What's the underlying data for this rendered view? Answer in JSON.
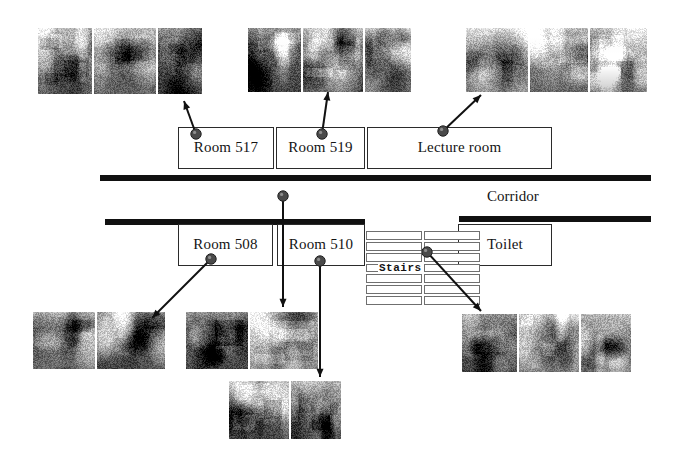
{
  "figure": {
    "background_color": "#ffffff",
    "line_color": "#111111",
    "marker_color": "#4a4a4a",
    "width": 694,
    "height": 473
  },
  "labels": {
    "corridor": "Corridor",
    "stairs": "Stairs"
  },
  "upper_rooms": [
    {
      "id": "room-517",
      "label": "Room 517",
      "x": 178,
      "y": 127,
      "w": 96,
      "h": 42
    },
    {
      "id": "room-519",
      "label": "Room 519",
      "x": 276,
      "y": 127,
      "w": 89,
      "h": 42
    },
    {
      "id": "lecture-room",
      "label": "Lecture room",
      "x": 367,
      "y": 127,
      "w": 185,
      "h": 42
    }
  ],
  "lower_rooms": [
    {
      "id": "room-508",
      "label": "Room 508",
      "x": 178,
      "y": 224,
      "w": 95,
      "h": 42
    },
    {
      "id": "room-510",
      "label": "Room 510",
      "x": 277,
      "y": 224,
      "w": 88,
      "h": 42
    },
    {
      "id": "toilet",
      "label": "Toilet",
      "x": 458,
      "y": 224,
      "w": 94,
      "h": 42
    }
  ],
  "corridor_bars": [
    {
      "id": "upper-corridor-bar",
      "x": 100,
      "y": 175,
      "w": 551,
      "h": 6
    },
    {
      "id": "lower-corridor-bar-left",
      "x": 105,
      "y": 219,
      "w": 260,
      "h": 6
    },
    {
      "id": "lower-corridor-bar-right",
      "x": 459,
      "y": 216,
      "w": 192,
      "h": 6
    }
  ],
  "corridor_label_pos": {
    "x": 487,
    "y": 188
  },
  "stairs": {
    "label_pos": {
      "x": 378,
      "y": 262
    },
    "left_column": {
      "x": 366,
      "y": 231,
      "w": 56,
      "h": 76,
      "steps": 7
    },
    "right_column": {
      "x": 424,
      "y": 231,
      "w": 56,
      "h": 76,
      "steps": 7
    }
  },
  "markers": [
    {
      "id": "marker-room-517",
      "x": 196,
      "y": 134
    },
    {
      "id": "marker-room-519",
      "x": 322,
      "y": 134
    },
    {
      "id": "marker-lecture-room",
      "x": 443,
      "y": 131
    },
    {
      "id": "marker-room-508-upper",
      "x": 283,
      "y": 196
    },
    {
      "id": "marker-room-508",
      "x": 211,
      "y": 259
    },
    {
      "id": "marker-room-510",
      "x": 320,
      "y": 261
    },
    {
      "id": "marker-stairs",
      "x": 427,
      "y": 252
    }
  ],
  "connectors": [
    {
      "id": "connector-room-517",
      "from": [
        196,
        134
      ],
      "to": [
        184,
        101
      ],
      "arrow": true
    },
    {
      "id": "connector-room-519",
      "from": [
        322,
        134
      ],
      "to": [
        328,
        92
      ],
      "arrow": true
    },
    {
      "id": "connector-lecture-room",
      "from": [
        443,
        131
      ],
      "to": [
        481,
        95
      ],
      "arrow": true
    },
    {
      "id": "connector-corridor-photo",
      "from": [
        283,
        196
      ],
      "to": [
        283,
        307
      ],
      "arrow": true
    },
    {
      "id": "connector-room-508",
      "from": [
        211,
        259
      ],
      "to": [
        152,
        318
      ],
      "arrow": true
    },
    {
      "id": "connector-room-510",
      "from": [
        320,
        261
      ],
      "to": [
        320,
        377
      ],
      "arrow": true
    },
    {
      "id": "connector-stairs",
      "from": [
        427,
        252
      ],
      "to": [
        481,
        311
      ],
      "arrow": true
    }
  ],
  "photo_clusters": [
    {
      "id": "photos-room-517",
      "caption_room": "Room 517",
      "x": 38,
      "y": 28,
      "photos": [
        {
          "id": "photo-517-a",
          "scene": "cluttered office with equipment",
          "w": 54,
          "h": 66,
          "seed": 11,
          "tone": "mid"
        },
        {
          "id": "photo-517-b",
          "scene": "office shelving and monitors",
          "w": 62,
          "h": 66,
          "seed": 23,
          "tone": "mid"
        },
        {
          "id": "photo-517-c",
          "scene": "cabinet wall",
          "w": 44,
          "h": 66,
          "seed": 37,
          "tone": "dark"
        }
      ]
    },
    {
      "id": "photos-room-519",
      "caption_room": "Room 519",
      "x": 248,
      "y": 28,
      "photos": [
        {
          "id": "photo-519-a",
          "scene": "bookshelves and desk",
          "w": 53,
          "h": 64,
          "seed": 41,
          "tone": "dark"
        },
        {
          "id": "photo-519-b",
          "scene": "bookshelves full of books",
          "w": 60,
          "h": 64,
          "seed": 53,
          "tone": "mid"
        },
        {
          "id": "photo-519-c",
          "scene": "desk with papers",
          "w": 46,
          "h": 64,
          "seed": 59,
          "tone": "light"
        }
      ]
    },
    {
      "id": "photos-lecture-room",
      "caption_room": "Lecture room",
      "x": 466,
      "y": 28,
      "photos": [
        {
          "id": "photo-lecture-a",
          "scene": "lecture room desks front view",
          "w": 62,
          "h": 64,
          "seed": 67,
          "tone": "light"
        },
        {
          "id": "photo-lecture-b",
          "scene": "lecture room with blackboard",
          "w": 58,
          "h": 64,
          "seed": 71,
          "tone": "mid"
        },
        {
          "id": "photo-lecture-c",
          "scene": "lecture room rows of desks",
          "w": 57,
          "h": 64,
          "seed": 79,
          "tone": "light"
        }
      ]
    },
    {
      "id": "photos-room-508",
      "caption_room": "Room 508",
      "x": 33,
      "y": 312,
      "photos": [
        {
          "id": "photo-508-a",
          "scene": "laboratory benches",
          "w": 62,
          "h": 57,
          "seed": 83,
          "tone": "mid"
        },
        {
          "id": "photo-508-b",
          "scene": "laboratory with equipment",
          "w": 68,
          "h": 57,
          "seed": 89,
          "tone": "dark"
        }
      ]
    },
    {
      "id": "photos-corridor",
      "caption_room": "Corridor near Room 508",
      "x": 186,
      "y": 312,
      "photos": [
        {
          "id": "photo-corridor-a",
          "scene": "corridor perspective view",
          "w": 62,
          "h": 57,
          "seed": 97,
          "tone": "dark"
        },
        {
          "id": "photo-corridor-b",
          "scene": "notice board on wall",
          "w": 68,
          "h": 57,
          "seed": 101,
          "tone": "light"
        }
      ]
    },
    {
      "id": "photos-room-510",
      "caption_room": "Room 510",
      "x": 229,
      "y": 381,
      "photos": [
        {
          "id": "photo-510-a",
          "scene": "room interior with doorway",
          "w": 60,
          "h": 58,
          "seed": 103,
          "tone": "dark"
        },
        {
          "id": "photo-510-b",
          "scene": "room interior with desk",
          "w": 50,
          "h": 58,
          "seed": 107,
          "tone": "mid"
        }
      ]
    },
    {
      "id": "photos-stairs",
      "caption_room": "Stairs",
      "x": 462,
      "y": 314,
      "photos": [
        {
          "id": "photo-stairs-a",
          "scene": "staircase going down",
          "w": 55,
          "h": 58,
          "seed": 109,
          "tone": "dark"
        },
        {
          "id": "photo-stairs-b",
          "scene": "stair landing with window",
          "w": 60,
          "h": 58,
          "seed": 113,
          "tone": "light"
        },
        {
          "id": "photo-stairs-c",
          "scene": "staircase going up",
          "w": 50,
          "h": 58,
          "seed": 127,
          "tone": "mid"
        }
      ]
    }
  ]
}
